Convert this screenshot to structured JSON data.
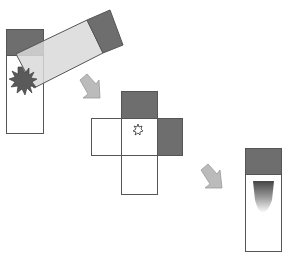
{
  "diagram": {
    "colors": {
      "cap": "#6e6e6e",
      "tube_fill": "#ffffff",
      "tube_stroke": "#555555",
      "tilted_fill": "#d8d8d8",
      "arrow": "#b8b8b8",
      "sample": "#555555"
    },
    "steps": [
      {
        "id": "step1",
        "label": "Tube with sample, tilted",
        "element": "tube-upright-and-tilted"
      },
      {
        "id": "step2",
        "label": "Unfolded box with particle",
        "element": "cross-net"
      },
      {
        "id": "step3",
        "label": "Tube with sediment gradient",
        "element": "tube-final"
      }
    ],
    "arrows": [
      {
        "from": "step1",
        "to": "step2"
      },
      {
        "from": "step2",
        "to": "step3"
      }
    ]
  }
}
